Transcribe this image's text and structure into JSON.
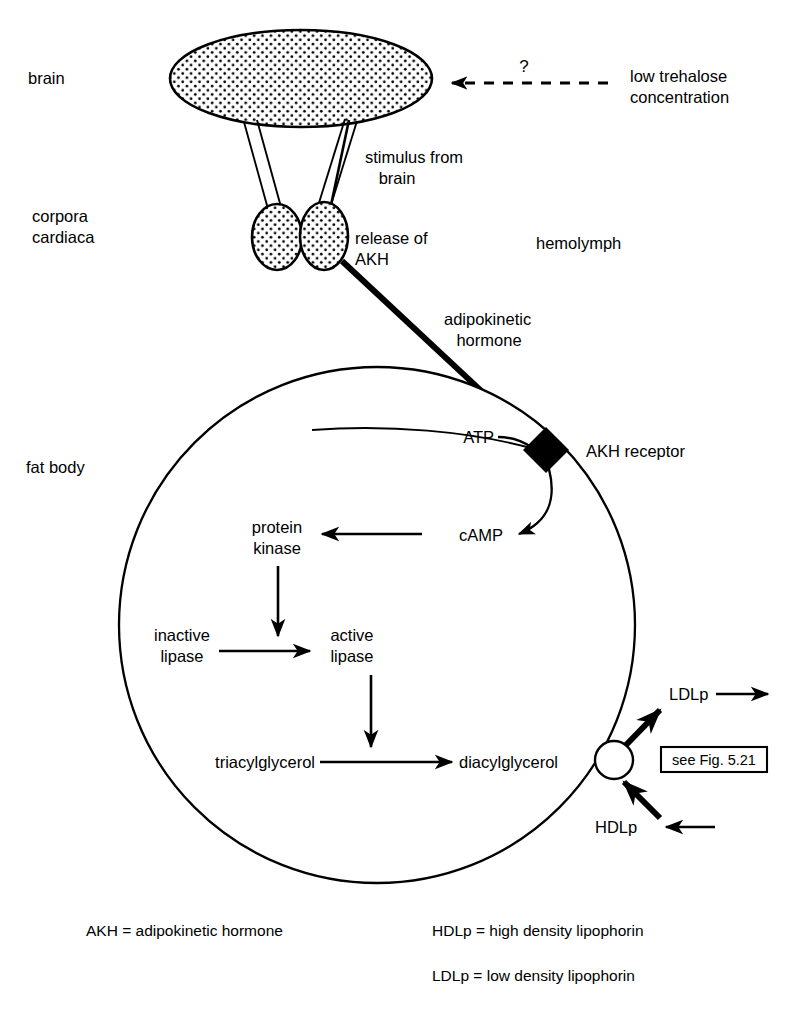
{
  "figure": {
    "colors": {
      "ink": "#000000",
      "background": "#ffffff",
      "receptor_fill": "#000000",
      "organ_fill": "#ffffff",
      "stipple": "#000000"
    }
  },
  "anatomy_labels": {
    "brain": "brain",
    "corpora_cardiaca": "corpora\ncardiaca",
    "corpora_cardiaca_line1": "corpora",
    "corpora_cardiaca_line2": "cardiaca",
    "fat_body": "fat body",
    "hemolymph": "hemolymph"
  },
  "signals": {
    "low_trehalose_line1": "low trehalose",
    "low_trehalose_line2": "concentration",
    "question_mark": "?",
    "stimulus_line1": "stimulus from",
    "stimulus_line2": "brain",
    "release_line1": "release of",
    "release_line2": "AKH",
    "adipokinetic_line1": "adipokinetic",
    "adipokinetic_line2": "hormone"
  },
  "membrane": {
    "receptor_label": "AKH receptor",
    "receptor_shape": "black-diamond",
    "transporter_shape": "white-circle"
  },
  "cascade": {
    "atp": "ATP",
    "camp": "cAMP",
    "protein_kinase_line1": "protein",
    "protein_kinase_line2": "kinase",
    "inactive_lipase_line1": "inactive",
    "inactive_lipase_line2": "lipase",
    "active_lipase_line1": "active",
    "active_lipase_line2": "lipase",
    "triacylglycerol": "triacylglycerol",
    "diacylglycerol": "diacylglycerol"
  },
  "lipophorins": {
    "ldlp": "LDLp",
    "hdlp": "HDLp"
  },
  "cross_reference": {
    "see_figure": "see Fig. 5.21"
  },
  "legend": {
    "akh": "AKH = adipokinetic hormone",
    "hdlp": "HDLp = high density lipophorin",
    "ldlp": "LDLp = low density lipophorin"
  },
  "pathway_steps": [
    "low trehalose concentration (?) -> brain",
    "brain -> stimulus from brain -> corpora cardiaca",
    "corpora cardiaca -> release of AKH",
    "AKH travels through hemolymph as adipokinetic hormone -> AKH receptor",
    "ATP -> AKH receptor",
    "AKH receptor -> cAMP",
    "cAMP -> protein kinase",
    "protein kinase -> activates: inactive lipase -> active lipase",
    "active lipase -> catalyses: triacylglycerol -> diacylglycerol",
    "diacylglycerol -> transporter -> LDLp (out of fat body)",
    "HDLp (in) -> transporter"
  ]
}
